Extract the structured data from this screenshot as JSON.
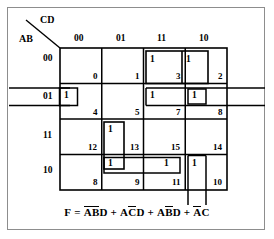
{
  "diagram": {
    "type": "karnaugh-map",
    "title_vars": {
      "columns_label": "CD",
      "rows_label": "AB"
    },
    "column_headers": [
      "00",
      "01",
      "11",
      "10"
    ],
    "row_headers": [
      "00",
      "01",
      "11",
      "10"
    ],
    "cells": [
      {
        "row": 0,
        "col": 0,
        "index": "0",
        "value": ""
      },
      {
        "row": 0,
        "col": 1,
        "index": "1",
        "value": ""
      },
      {
        "row": 0,
        "col": 2,
        "index": "3",
        "value": "1"
      },
      {
        "row": 0,
        "col": 3,
        "index": "2",
        "value": "1"
      },
      {
        "row": 1,
        "col": 0,
        "index": "4",
        "value": "1"
      },
      {
        "row": 1,
        "col": 1,
        "index": "5",
        "value": ""
      },
      {
        "row": 1,
        "col": 2,
        "index": "7",
        "value": "1"
      },
      {
        "row": 1,
        "col": 3,
        "index": "8",
        "value": "1"
      },
      {
        "row": 2,
        "col": 0,
        "index": "12",
        "value": ""
      },
      {
        "row": 2,
        "col": 1,
        "index": "13",
        "value": "1"
      },
      {
        "row": 2,
        "col": 2,
        "index": "15",
        "value": ""
      },
      {
        "row": 2,
        "col": 3,
        "index": "14",
        "value": ""
      },
      {
        "row": 3,
        "col": 0,
        "index": "8",
        "value": ""
      },
      {
        "row": 3,
        "col": 1,
        "index": "9",
        "value": "1"
      },
      {
        "row": 3,
        "col": 2,
        "index": "11",
        "value": "1"
      },
      {
        "row": 3,
        "col": 3,
        "index": "10",
        "value": "1"
      }
    ],
    "groups": [
      {
        "name": "group-row00-cols11-10"
      },
      {
        "name": "group-row01-wraparound"
      },
      {
        "name": "group-row01-col11-col10"
      },
      {
        "name": "group-col01-rows11-10"
      },
      {
        "name": "group-row10-cols01-11"
      },
      {
        "name": "group-col10-vertical-wrap"
      }
    ],
    "formula": {
      "lhs": "F",
      "equals": "=",
      "terms": [
        {
          "chars": [
            {
              "t": "A",
              "bar": true
            },
            {
              "t": "B",
              "bar": true
            },
            {
              "t": "D",
              "bar": false
            }
          ]
        },
        {
          "chars": [
            {
              "t": "A",
              "bar": false
            },
            {
              "t": "C",
              "bar": true
            },
            {
              "t": "D",
              "bar": false
            }
          ]
        },
        {
          "chars": [
            {
              "t": "A",
              "bar": false
            },
            {
              "t": "B",
              "bar": true
            },
            {
              "t": "D",
              "bar": false
            }
          ]
        },
        {
          "chars": [
            {
              "t": "A",
              "bar": true
            },
            {
              "t": "C",
              "bar": false
            }
          ]
        }
      ],
      "separator": "+",
      "plain_text": "F = ABD + ACD + ABD + AC"
    },
    "colors": {
      "ink": "#000000",
      "page_border": "#8d8d8d",
      "background": "#ffffff"
    }
  }
}
